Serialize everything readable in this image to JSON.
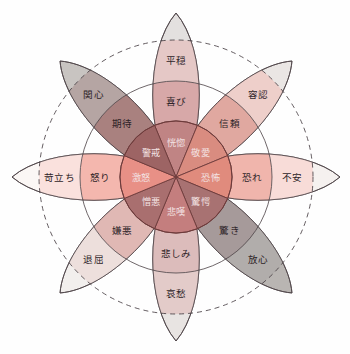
{
  "diagram": {
    "center": {
      "x": 176,
      "y": 177
    },
    "radii": {
      "core": 56,
      "middle": 96,
      "outer": 137
    },
    "petal_length": 164,
    "petal_width": 31,
    "colors": {
      "core_joy": "#c08484",
      "core_trust": "#d98c80",
      "core_fear": "#e08b7d",
      "core_surprise": "#a87272",
      "core_sadness": "#c47e7e",
      "core_disgust": "#a96f6f",
      "core_anger": "#e89086",
      "core_anticipation": "#9d6464",
      "ring_stroke": "#4a4044",
      "core_stroke": "#6d3b3b",
      "label_light": "#f3e2e2",
      "label_dark": "#2e2428",
      "background": "#fefefe"
    }
  },
  "chart_data": {
    "type": "pie",
    "xlabel": "",
    "ylabel": "",
    "legend_position": "none",
    "grid": false,
    "categories": [
      "喜び",
      "信頼",
      "恐れ",
      "驚き",
      "悲しみ",
      "嫌悪",
      "怒り",
      "期待"
    ],
    "values": [
      12.5,
      12.5,
      12.5,
      12.5,
      12.5,
      12.5,
      12.5,
      12.5
    ],
    "annotations": [
      "内側ほど強い感情、外側ほど弱い感情を表す"
    ]
  },
  "sectors": [
    {
      "id": "joy",
      "angle_deg": 270,
      "core": {
        "label": "恍惚",
        "fill": "#c08484"
      },
      "middle": {
        "label": "喜び",
        "fill": "#d7a8a8"
      },
      "outer": {
        "label": "平穏",
        "fill": "#e5c8c6"
      },
      "tip_fill": "#e3e0df"
    },
    {
      "id": "trust",
      "angle_deg": 315,
      "core": {
        "label": "敬愛",
        "fill": "#d98c80"
      },
      "middle": {
        "label": "信頼",
        "fill": "#e0a8a0"
      },
      "outer": {
        "label": "容認",
        "fill": "#eecfca"
      },
      "tip_fill": "#eae6e4"
    },
    {
      "id": "fear",
      "angle_deg": 0,
      "core": {
        "label": "恐怖",
        "fill": "#e08b7d"
      },
      "middle": {
        "label": "恐れ",
        "fill": "#f0b5ac"
      },
      "outer": {
        "label": "不安",
        "fill": "#f8dcd8"
      },
      "tip_fill": "#f5f1ef"
    },
    {
      "id": "surprise",
      "angle_deg": 45,
      "core": {
        "label": "驚愕",
        "fill": "#a87272"
      },
      "middle": {
        "label": "驚き",
        "fill": "#a69a9a"
      },
      "outer": {
        "label": "放心",
        "fill": "#b1adab"
      },
      "tip_fill": "#b9b5b2"
    },
    {
      "id": "sadness",
      "angle_deg": 90,
      "core": {
        "label": "悲嘆",
        "fill": "#c47e7e"
      },
      "middle": {
        "label": "悲しみ",
        "fill": "#dcbcbb"
      },
      "outer": {
        "label": "哀愁",
        "fill": "#e3cbc9"
      },
      "tip_fill": "#e8e4e2"
    },
    {
      "id": "disgust",
      "angle_deg": 135,
      "core": {
        "label": "憎悪",
        "fill": "#a96f6f"
      },
      "middle": {
        "label": "嫌悪",
        "fill": "#e0b8b4"
      },
      "outer": {
        "label": "退屈",
        "fill": "#eddfdc"
      },
      "tip_fill": "#f2efed"
    },
    {
      "id": "anger",
      "angle_deg": 180,
      "core": {
        "label": "激怒",
        "fill": "#e89086"
      },
      "middle": {
        "label": "怒り",
        "fill": "#f4b7ae"
      },
      "outer": {
        "label": "苛立ち",
        "fill": "#fae1dd"
      },
      "tip_fill": "#fbf7f5"
    },
    {
      "id": "anticipation",
      "angle_deg": 225,
      "core": {
        "label": "警戒",
        "fill": "#9d6464"
      },
      "middle": {
        "label": "期待",
        "fill": "#a9817f"
      },
      "outer": {
        "label": "関心",
        "fill": "#b5a5a3"
      },
      "tip_fill": "#c8c4c1"
    }
  ]
}
